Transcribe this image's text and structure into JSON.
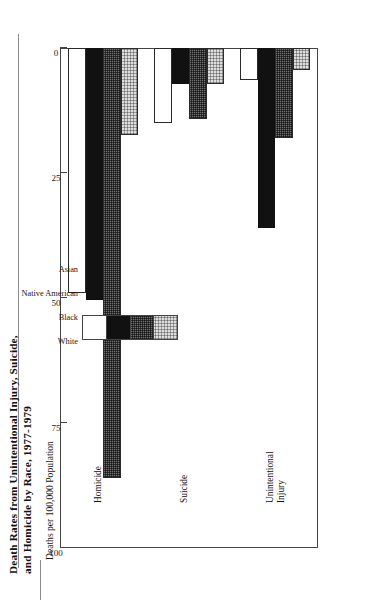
{
  "figure": {
    "title_line1": "Death Rates from Unintentional Injury, Suicide,",
    "title_line2": "and Homicide by Race, 1977-1979"
  },
  "chart_data": {
    "type": "bar",
    "orientation": "horizontal",
    "title": "Death Rates from Unintentional Injury, Suicide, and Homicide by Race, 1977-1979",
    "xlabel": "",
    "ylabel": "Deaths per 100,000 Population",
    "axis_title": "Deaths per 100,000 Population",
    "categories": [
      "Unintentional Injury",
      "Suicide",
      "Homicide"
    ],
    "category_labels": [
      [
        "Unintentional",
        "Injury"
      ],
      [
        "Suicide"
      ],
      [
        "Homicide"
      ]
    ],
    "tick_labels": [
      "100",
      "75",
      "50",
      "25",
      "0"
    ],
    "tick_values": [
      100,
      75,
      50,
      25,
      0
    ],
    "ylim": [
      0,
      100
    ],
    "grid": false,
    "legend_position": "inside-upper-right",
    "series": [
      {
        "name": "White",
        "swatch": "white",
        "values": [
          49.0,
          15.0,
          6.5
        ]
      },
      {
        "name": "Black",
        "swatch": "black",
        "values": [
          50.5,
          7.3,
          36.0
        ]
      },
      {
        "name": "Native American",
        "swatch": "native",
        "values": [
          86.0,
          14.2,
          18.0
        ]
      },
      {
        "name": "Asian",
        "swatch": "asian",
        "values": [
          17.5,
          7.3,
          4.5
        ]
      }
    ]
  },
  "legend": {
    "items": [
      {
        "label": "White"
      },
      {
        "label": "Black"
      },
      {
        "label": "Native American"
      },
      {
        "label": "Asian"
      }
    ]
  },
  "colors": {
    "white": "#ffffff",
    "black": "#111111",
    "native_american": "#6f6f6f",
    "asian": "#dedede",
    "frame": "#444444",
    "text": "#111111"
  }
}
